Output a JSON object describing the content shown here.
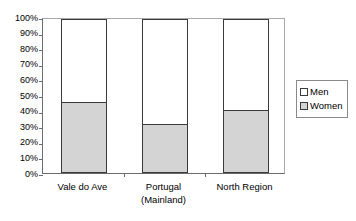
{
  "chart_data": {
    "type": "bar",
    "subtype": "stacked-100-percent",
    "title": "",
    "xlabel": "",
    "ylabel": "",
    "ylim": [
      0,
      100
    ],
    "grid": false,
    "legend_position": "right",
    "categories": [
      "Vale do Ave",
      "Portugal (Mainland)",
      "North Region"
    ],
    "category_lines": [
      [
        "Vale do Ave"
      ],
      [
        "Portugal",
        "(Mainland)"
      ],
      [
        "North Region"
      ]
    ],
    "ytick_labels": [
      "100%",
      "90%",
      "80%",
      "70%",
      "60%",
      "50%",
      "40%",
      "30%",
      "20%",
      "10%",
      "0%"
    ],
    "ytick_values": [
      100,
      90,
      80,
      70,
      60,
      50,
      40,
      30,
      20,
      10,
      0
    ],
    "series": [
      {
        "name": "Men",
        "color": "#ffffff",
        "values": [
          55,
          69,
          60
        ]
      },
      {
        "name": "Women",
        "color": "#d4d4d4",
        "values": [
          45,
          31,
          40
        ]
      }
    ]
  },
  "legend": {
    "entries": [
      {
        "label": "Men",
        "swatch": "men"
      },
      {
        "label": "Women",
        "swatch": "women"
      }
    ]
  }
}
